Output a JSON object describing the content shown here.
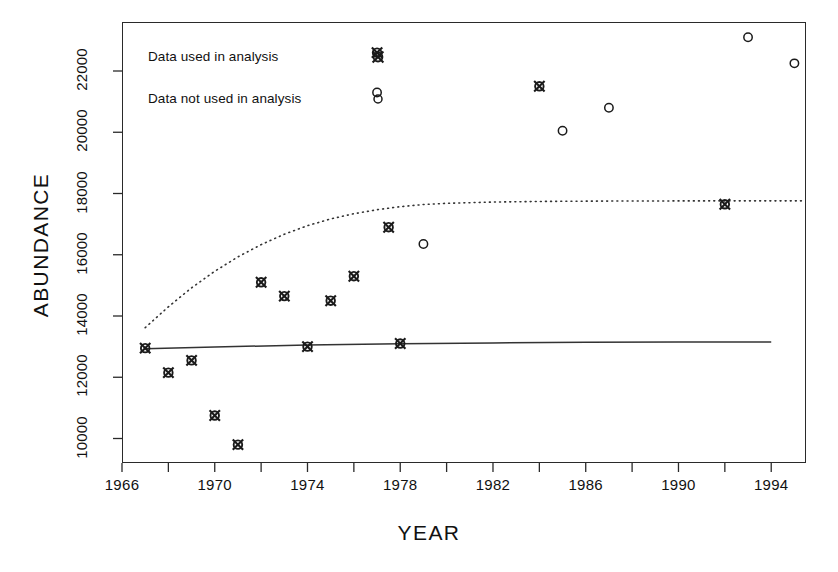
{
  "chart_data": {
    "type": "scatter",
    "title": "",
    "xlabel": "YEAR",
    "ylabel": "ABUNDANCE",
    "xlim": [
      1966,
      1995.5
    ],
    "ylim": [
      9200,
      23600
    ],
    "xticks": [
      1966,
      1968,
      1970,
      1972,
      1974,
      1976,
      1978,
      1980,
      1982,
      1984,
      1986,
      1988,
      1990,
      1992,
      1994
    ],
    "xtick_labels": [
      "1966",
      "",
      "1970",
      "",
      "1974",
      "",
      "1978",
      "",
      "1982",
      "",
      "1986",
      "",
      "1990",
      "",
      "1994"
    ],
    "yticks": [
      10000,
      12000,
      14000,
      16000,
      18000,
      20000,
      22000
    ],
    "ytick_labels": [
      "10000",
      "12000",
      "14000",
      "16000",
      "18000",
      "20000",
      "22000"
    ],
    "grid": false,
    "legend_position": "top-left",
    "series": [
      {
        "name": "Data used in analysis",
        "marker": "x-circle",
        "points": [
          {
            "x": 1967.0,
            "y": 12950
          },
          {
            "x": 1968.0,
            "y": 12150
          },
          {
            "x": 1969.0,
            "y": 12550
          },
          {
            "x": 1970.0,
            "y": 10750
          },
          {
            "x": 1971.0,
            "y": 9800
          },
          {
            "x": 1972.0,
            "y": 15100
          },
          {
            "x": 1973.0,
            "y": 14650
          },
          {
            "x": 1974.0,
            "y": 13000
          },
          {
            "x": 1975.0,
            "y": 14500
          },
          {
            "x": 1976.0,
            "y": 15300
          },
          {
            "x": 1977.0,
            "y": 22600
          },
          {
            "x": 1977.5,
            "y": 16900
          },
          {
            "x": 1978.0,
            "y": 13100
          },
          {
            "x": 1984.0,
            "y": 21500
          },
          {
            "x": 1992.0,
            "y": 17650
          }
        ]
      },
      {
        "name": "Data not used in analysis",
        "marker": "circle",
        "points": [
          {
            "x": 1977.0,
            "y": 21300
          },
          {
            "x": 1979.0,
            "y": 16350
          },
          {
            "x": 1985.0,
            "y": 20050
          },
          {
            "x": 1987.0,
            "y": 20800
          },
          {
            "x": 1993.0,
            "y": 23100
          },
          {
            "x": 1995.0,
            "y": 22250
          }
        ]
      }
    ],
    "curves": [
      {
        "name": "upper-fitted-curve",
        "style": "dotted",
        "points": [
          {
            "x": 1967.0,
            "y": 13620
          },
          {
            "x": 1968.0,
            "y": 14300
          },
          {
            "x": 1969.0,
            "y": 14920
          },
          {
            "x": 1970.0,
            "y": 15460
          },
          {
            "x": 1971.0,
            "y": 15930
          },
          {
            "x": 1972.0,
            "y": 16330
          },
          {
            "x": 1973.0,
            "y": 16670
          },
          {
            "x": 1974.0,
            "y": 16950
          },
          {
            "x": 1975.0,
            "y": 17170
          },
          {
            "x": 1976.0,
            "y": 17340
          },
          {
            "x": 1977.0,
            "y": 17470
          },
          {
            "x": 1978.0,
            "y": 17570
          },
          {
            "x": 1979.0,
            "y": 17640
          },
          {
            "x": 1980.0,
            "y": 17680
          },
          {
            "x": 1982.0,
            "y": 17720
          },
          {
            "x": 1984.0,
            "y": 17740
          },
          {
            "x": 1986.0,
            "y": 17750
          },
          {
            "x": 1988.0,
            "y": 17755
          },
          {
            "x": 1990.0,
            "y": 17758
          },
          {
            "x": 1992.0,
            "y": 17760
          },
          {
            "x": 1994.0,
            "y": 17760
          },
          {
            "x": 1995.3,
            "y": 17760
          }
        ]
      },
      {
        "name": "lower-fitted-curve",
        "style": "solid",
        "points": [
          {
            "x": 1967.0,
            "y": 12930
          },
          {
            "x": 1970.0,
            "y": 12990
          },
          {
            "x": 1974.0,
            "y": 13050
          },
          {
            "x": 1978.0,
            "y": 13090
          },
          {
            "x": 1982.0,
            "y": 13120
          },
          {
            "x": 1986.0,
            "y": 13140
          },
          {
            "x": 1990.0,
            "y": 13150
          },
          {
            "x": 1994.0,
            "y": 13155
          }
        ]
      }
    ]
  },
  "legend": {
    "items": [
      {
        "label": "Data used in analysis",
        "marker": "x-circle"
      },
      {
        "label": "Data not used in analysis",
        "marker": "circle"
      }
    ]
  },
  "colors": {
    "axis": "#2a2a2a",
    "marker": "#1a1a1a",
    "curve": "#333333",
    "text": "#111111"
  }
}
